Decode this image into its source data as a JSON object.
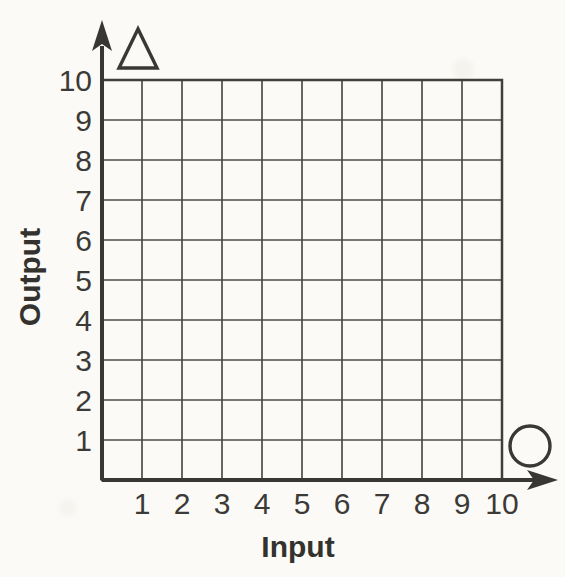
{
  "chart_data": {
    "type": "grid",
    "title": "",
    "xlabel": "Input",
    "ylabel": "Output",
    "x_ticks": [
      "1",
      "2",
      "3",
      "4",
      "5",
      "6",
      "7",
      "8",
      "9",
      "10"
    ],
    "y_ticks": [
      "1",
      "2",
      "3",
      "4",
      "5",
      "6",
      "7",
      "8",
      "9",
      "10"
    ],
    "xlim": [
      0,
      10
    ],
    "ylim": [
      0,
      10
    ],
    "grid": true,
    "series": [],
    "annotations": [
      {
        "icon": "triangle-icon",
        "description": "empty outlined triangle beside y-axis arrow"
      },
      {
        "icon": "circle-icon",
        "description": "empty outlined circle beside x-axis arrow"
      }
    ]
  },
  "colors": {
    "background": "#fbfaf6",
    "ink": "#383734",
    "gridline": "#4c4b47"
  }
}
